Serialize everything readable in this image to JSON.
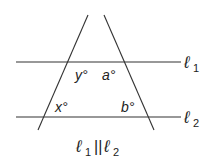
{
  "diagram": {
    "type": "parallel lines cut by two transversals",
    "lines": {
      "l1": {
        "label": "ℓ",
        "subscript": "1"
      },
      "l2": {
        "label": "ℓ",
        "subscript": "2"
      }
    },
    "angles": {
      "y": "y°",
      "a": "a°",
      "x": "x°",
      "b": "b°"
    },
    "caption": {
      "left": "ℓ",
      "left_sub": "1",
      "symbol": "||",
      "right": "ℓ",
      "right_sub": "2"
    },
    "colors": {
      "stroke": "#333333",
      "text": "#222222",
      "background": "#ffffff"
    }
  }
}
